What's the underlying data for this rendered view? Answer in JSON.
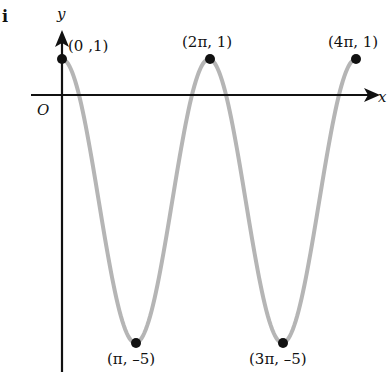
{
  "part_label": "i",
  "chart_data": {
    "type": "line",
    "title": "",
    "xlabel": "x",
    "ylabel": "y",
    "origin_label": "O",
    "function_description": "cosine-type curve with max 1 and min -5, period 2π",
    "x": [
      "0",
      "π",
      "2π",
      "3π",
      "4π"
    ],
    "y": [
      1,
      -5,
      1,
      -5,
      1
    ],
    "points": [
      {
        "label": "(0 ,1)",
        "x": 0,
        "y": 1
      },
      {
        "label": "(π, –5)",
        "x": 3.14159,
        "y": -5
      },
      {
        "label": "(2π, 1)",
        "x": 6.28318,
        "y": 1
      },
      {
        "label": "(3π, –5)",
        "x": 9.42478,
        "y": -5
      },
      {
        "label": "(4π, 1)",
        "x": 12.56637,
        "y": 1
      }
    ],
    "grid": false,
    "legend": null,
    "curve_color": "#b5b5b5",
    "axis_color": "#111111"
  }
}
